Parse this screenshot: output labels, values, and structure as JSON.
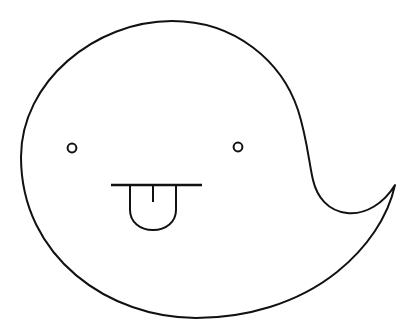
{
  "meta": {
    "title": "Ghost Face Doodle",
    "canvas_width": 417,
    "canvas_height": 335
  },
  "colors": {
    "background": "#ffffff",
    "stroke": "#111111"
  },
  "figure": {
    "name": "ghost-blob",
    "label": "Ghost blob",
    "body_path": "M 21 157 C 21 82 95 21 172 21 C 236 21 282 62 298 110 C 307 138 309 163 313 180 C 317 197 328 211 347 213 C 366 215 384 203 395 185 C 388 217 367 248 337 272 C 297 304 245 318 196 318 C 110 318 21 258 21 157 Z",
    "tail_inner_path": "M 395 185 C 384 203 366 215 347 213 C 328 211 317 197 313 180",
    "parts": [
      {
        "name": "left-eye",
        "label": "Left eye",
        "shape": "circle",
        "cx": 72,
        "cy": 148,
        "r": 4.4
      },
      {
        "name": "right-eye",
        "label": "Right eye",
        "shape": "circle",
        "cx": 238,
        "cy": 147,
        "r": 4.4
      },
      {
        "name": "mouth-line",
        "label": "Mouth line",
        "shape": "line",
        "x1": 111,
        "y1": 185,
        "x2": 202,
        "y2": 185
      },
      {
        "name": "tongue",
        "label": "Tongue",
        "shape": "path",
        "path": "M 130 186 L 130 210 C 130 222 140 230 153 230 C 166 230 176 222 176 210 L 176 186"
      },
      {
        "name": "tongue-tick",
        "label": "Tongue center tick",
        "shape": "line",
        "x1": 153,
        "y1": 186,
        "x2": 153,
        "y2": 202
      }
    ]
  }
}
